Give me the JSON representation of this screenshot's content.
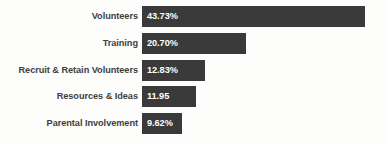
{
  "chart_data": {
    "type": "bar",
    "orientation": "horizontal",
    "title": "",
    "subtitle": "",
    "xlabel": "",
    "ylabel": "",
    "grid": false,
    "legend": null,
    "axis_visible": false,
    "tick_labels": [],
    "categories": [
      "Volunteers",
      "Training",
      "Recruit & Retain Volunteers",
      "Resources & Ideas",
      "Parental Involvement"
    ],
    "values": [
      43.73,
      20.7,
      12.83,
      11.95,
      9.62
    ],
    "value_labels": [
      "43.73%",
      "20.70%",
      "12.83%",
      "11.95",
      "9.62%"
    ],
    "bar_pixel_widths": [
      223,
      104,
      63,
      54,
      40
    ],
    "colors": {
      "bar": "#3a3a3a",
      "background": "#fdfdfb",
      "label_text": "#403f3e",
      "value_text": "#ffffff"
    }
  },
  "rows": [
    {
      "label": "Volunteers",
      "value_label": "43.73%",
      "width": 223,
      "top": 6
    },
    {
      "label": "Training",
      "value_label": "20.70%",
      "width": 104,
      "top": 33
    },
    {
      "label": "Recruit & Retain Volunteers",
      "value_label": "12.83%",
      "width": 63,
      "top": 60
    },
    {
      "label": "Resources & Ideas",
      "value_label": "11.95",
      "width": 54,
      "top": 86
    },
    {
      "label": "Parental Involvement",
      "value_label": "9.62%",
      "width": 40,
      "top": 113
    }
  ]
}
